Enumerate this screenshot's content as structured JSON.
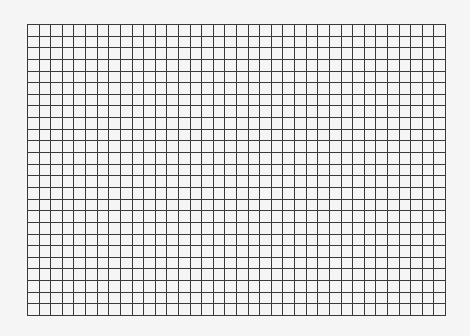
{
  "grid": {
    "columns": 36,
    "rows": 25,
    "line_color": "#3a3a3a",
    "background": "#f5f5f5"
  }
}
